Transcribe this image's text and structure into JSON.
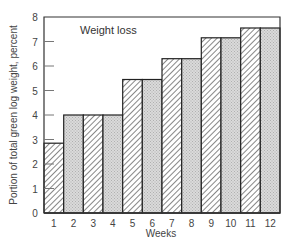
{
  "chart_data": {
    "type": "bar",
    "title": "",
    "annotation": "Weight loss",
    "xlabel": "Weeks",
    "ylabel": "Portion of total green log weight, percent",
    "categories": [
      "1",
      "2",
      "3",
      "4",
      "5",
      "6",
      "7",
      "8",
      "9",
      "10",
      "11",
      "12"
    ],
    "values": [
      2.85,
      4.0,
      4.0,
      4.0,
      5.45,
      5.45,
      6.3,
      6.3,
      7.15,
      7.15,
      7.55,
      7.55
    ],
    "ylim": [
      0,
      8
    ],
    "yticks": [
      0,
      1,
      2,
      3,
      4,
      5,
      6,
      7,
      8
    ],
    "grid": false,
    "legend": "none",
    "bar_fill_patterns": [
      "hatch",
      "dots",
      "hatch",
      "dots",
      "hatch",
      "dots",
      "hatch",
      "dots",
      "hatch",
      "dots",
      "hatch",
      "dots"
    ]
  },
  "colors": {
    "axis": "#333333",
    "bar_edge": "#222222",
    "hatch": "#555555",
    "dots_bg": "#d8d8d8"
  }
}
